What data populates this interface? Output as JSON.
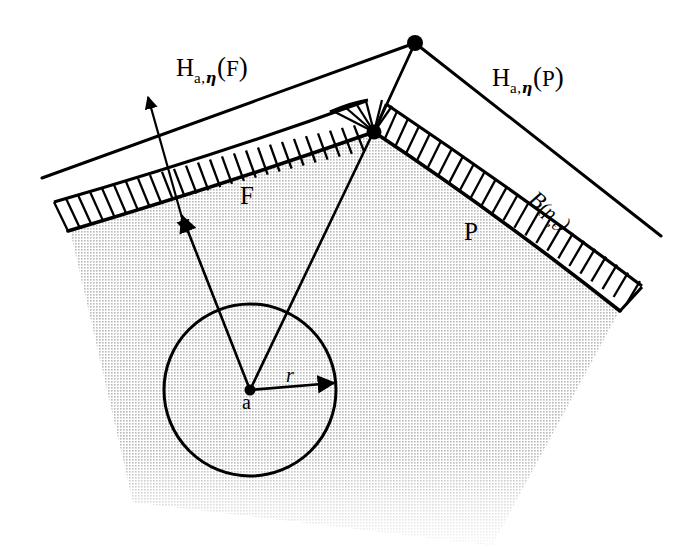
{
  "figure": {
    "background": "#ffffff",
    "ink_color": "#000000",
    "fill_color": "#e3e3e3",
    "width": 700,
    "height": 560
  },
  "labels": {
    "halfplane_F": {
      "base": "H",
      "subscript": "a,",
      "subscript_greek": "η",
      "open": "(",
      "arg": "F",
      "close": ")"
    },
    "halfplane_P": {
      "base": "H",
      "subscript": "a,",
      "subscript_greek": "η",
      "open": "(",
      "arg": "P",
      "close": ")"
    },
    "ball": {
      "base": "B",
      "open": "(",
      "arg": "p",
      "comma": ",",
      "eps": "ϵ",
      "close": ")"
    },
    "face_F": "F",
    "point_P": "P",
    "center_a": "a",
    "radius_r": "r"
  },
  "geometry": {
    "apex_point": {
      "x": 415,
      "y": 43
    },
    "vertex_point": {
      "x": 374,
      "y": 132
    },
    "center_point": {
      "x": 250,
      "y": 390
    },
    "circle_radius": 86,
    "radius_arrow_end": {
      "x": 334,
      "y": 382
    },
    "polygon_outline": [
      [
        70,
        230
      ],
      [
        374,
        132
      ],
      [
        620,
        310
      ],
      [
        490,
        545
      ],
      [
        135,
        500
      ]
    ],
    "outer_line_left": [
      [
        42,
        178
      ],
      [
        415,
        43
      ]
    ],
    "outer_line_right": [
      [
        415,
        43
      ],
      [
        660,
        235
      ]
    ],
    "band_hatch_count_left": 26,
    "band_hatch_count_right": 24,
    "width_arrow": {
      "from": {
        "x": 148,
        "y": 98
      },
      "to": {
        "x": 184,
        "y": 228
      }
    }
  }
}
